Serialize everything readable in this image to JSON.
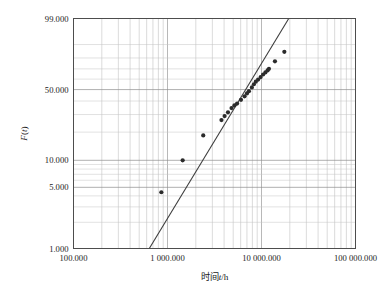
{
  "chart_data": {
    "type": "scatter",
    "title": "",
    "subtitle": "",
    "xlabel": "时间 t/h",
    "ylabel": "F(t)",
    "xscale": "log10",
    "yscale": "weibull-probability",
    "grid": true,
    "legend": null,
    "xlim": [
      100.0,
      100000.0
    ],
    "ylim": [
      1.0,
      99.0
    ],
    "x_tick_labels": [
      "100.000",
      "1 000.000",
      "10 000.000",
      "100 000.000"
    ],
    "x_tick_values": [
      100.0,
      1000.0,
      10000.0,
      100000.0
    ],
    "y_tick_labels": [
      "99.000",
      "50.000",
      "10.000",
      "5.000",
      "1.000"
    ],
    "y_tick_values": [
      99.0,
      50.0,
      10.0,
      5.0,
      1.0
    ],
    "y_minor_gridline_values": [
      90.0,
      80.0,
      70.0,
      60.0,
      40.0,
      30.0,
      20.0,
      9.0,
      8.0,
      7.0,
      6.0,
      4.0,
      3.0,
      2.0
    ],
    "series": [
      {
        "name": "实测数据点",
        "marker": "filled-circle",
        "points": [
          {
            "t": 860.0,
            "F": 4.4
          },
          {
            "t": 1450.0,
            "F": 10.0
          },
          {
            "t": 2400.0,
            "F": 18.5
          },
          {
            "t": 3750.0,
            "F": 26.5
          },
          {
            "t": 4050.0,
            "F": 29.0
          },
          {
            "t": 4400.0,
            "F": 31.5
          },
          {
            "t": 4800.0,
            "F": 34.5
          },
          {
            "t": 5150.0,
            "F": 36.5
          },
          {
            "t": 5500.0,
            "F": 38.0
          },
          {
            "t": 6050.0,
            "F": 41.0
          },
          {
            "t": 6600.0,
            "F": 44.0
          },
          {
            "t": 7000.0,
            "F": 46.5
          },
          {
            "t": 7350.0,
            "F": 48.5
          },
          {
            "t": 7900.0,
            "F": 52.0
          },
          {
            "t": 8300.0,
            "F": 55.0
          },
          {
            "t": 8700.0,
            "F": 57.5
          },
          {
            "t": 9200.0,
            "F": 59.5
          },
          {
            "t": 9800.0,
            "F": 62.0
          },
          {
            "t": 10400.0,
            "F": 64.5
          },
          {
            "t": 11000.0,
            "F": 66.5
          },
          {
            "t": 11600.0,
            "F": 68.5
          },
          {
            "t": 12000.0,
            "F": 70.0
          },
          {
            "t": 13900.0,
            "F": 77.0
          },
          {
            "t": 17500.0,
            "F": 85.0
          }
        ]
      }
    ],
    "fit_line": {
      "name": "拟合直线",
      "p1": {
        "t": 640.0,
        "F": 1.0
      },
      "p2": {
        "t": 19500.0,
        "F": 99.0
      }
    }
  },
  "axes": {
    "y_axis_label": "F(t)",
    "x_axis_label": "时间 t/h"
  }
}
